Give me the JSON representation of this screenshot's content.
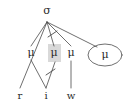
{
  "figure": {
    "type": "linguistic-tree-diagram",
    "stroke_color": "#4a4a4a",
    "text_color": "#2b2b2b",
    "highlight_color": "#d9d9d9",
    "background": "#ffffff"
  },
  "nodes": {
    "root": {
      "label": "σ",
      "name": "sigma-node",
      "x": 47,
      "y": 11
    },
    "moras": [
      {
        "label": "μ",
        "name": "mu-node-1",
        "x": 31,
        "y": 53,
        "highlighted": false,
        "circled": false
      },
      {
        "label": "μ",
        "name": "mu-node-2",
        "x": 54,
        "y": 53,
        "highlighted": true,
        "circled": false
      },
      {
        "label": "μ",
        "name": "mu-node-3",
        "x": 71,
        "y": 53,
        "highlighted": false,
        "circled": false
      },
      {
        "label": "μ",
        "name": "mu-node-4",
        "x": 105,
        "y": 55,
        "highlighted": false,
        "circled": true
      }
    ]
  },
  "segments": [
    {
      "label": "r",
      "name": "segment-r",
      "x": 20,
      "y": 96
    },
    {
      "label": "i",
      "name": "segment-i",
      "x": 46,
      "y": 96
    },
    {
      "label": "w",
      "name": "segment-w",
      "x": 71,
      "y": 96
    }
  ],
  "edges": [
    {
      "name": "edge-sigma-to-r",
      "from": "sigma",
      "to": "r",
      "x1": 47,
      "y1": 22,
      "x2": 20,
      "y2": 88,
      "struck": false
    },
    {
      "name": "edge-sigma-to-mu1",
      "from": "sigma",
      "to": "mu1",
      "x1": 47,
      "y1": 22,
      "x2": 31,
      "y2": 46,
      "struck": false
    },
    {
      "name": "edge-sigma-to-mu2",
      "from": "sigma",
      "to": "mu2",
      "x1": 47,
      "y1": 22,
      "x2": 54,
      "y2": 46,
      "struck": true
    },
    {
      "name": "edge-sigma-to-mu3",
      "from": "sigma",
      "to": "mu3",
      "x1": 47,
      "y1": 22,
      "x2": 71,
      "y2": 46,
      "struck": false
    },
    {
      "name": "edge-sigma-to-mu4",
      "from": "sigma",
      "to": "mu4",
      "x1": 47,
      "y1": 22,
      "x2": 96,
      "y2": 47,
      "struck": false
    },
    {
      "name": "edge-mu1-to-i",
      "from": "mu1",
      "to": "i",
      "x1": 31,
      "y1": 60,
      "x2": 46,
      "y2": 88,
      "struck": false
    },
    {
      "name": "edge-mu2-to-i",
      "from": "mu2",
      "to": "i",
      "x1": 54,
      "y1": 62,
      "x2": 46,
      "y2": 88,
      "struck": true
    },
    {
      "name": "edge-mu3-to-w",
      "from": "mu3",
      "to": "w",
      "x1": 71,
      "y1": 60,
      "x2": 71,
      "y2": 88,
      "struck": false
    }
  ],
  "strike_marks": [
    {
      "name": "strike-mark-upper",
      "cx": 52,
      "cy": 34
    },
    {
      "name": "strike-mark-lower",
      "cx": 50,
      "cy": 72
    }
  ],
  "ellipse": {
    "name": "mu-ellipse",
    "cx": 105,
    "cy": 55,
    "rx": 17,
    "ry": 11
  }
}
